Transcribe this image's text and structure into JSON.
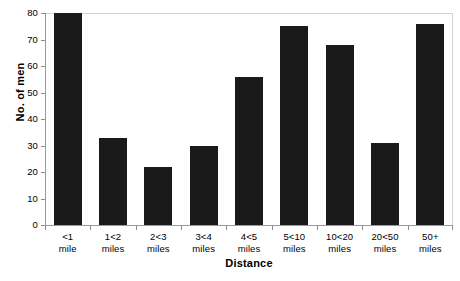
{
  "chart_data": {
    "type": "bar",
    "title": "",
    "xlabel": "Distance",
    "ylabel": "No. of men",
    "categories": [
      "<1 mile",
      "1<2 miles",
      "2<3 miles",
      "3<4 miles",
      "4<5 miles",
      "5<10 miles",
      "10<20 miles",
      "20<50 miles",
      "50+ miles"
    ],
    "category_lines": [
      {
        "line1": "<1",
        "line2": "mile"
      },
      {
        "line1": "1<2",
        "line2": "miles"
      },
      {
        "line1": "2<3",
        "line2": "miles"
      },
      {
        "line1": "3<4",
        "line2": "miles"
      },
      {
        "line1": "4<5",
        "line2": "miles"
      },
      {
        "line1": "5<10",
        "line2": "miles"
      },
      {
        "line1": "10<20",
        "line2": "miles"
      },
      {
        "line1": "20<50",
        "line2": "miles"
      },
      {
        "line1": "50+",
        "line2": "miles"
      }
    ],
    "values": [
      80,
      33,
      22,
      30,
      56,
      75,
      68,
      31,
      76
    ],
    "ylim": [
      0,
      80
    ],
    "yticks": [
      0,
      10,
      20,
      30,
      40,
      50,
      60,
      70,
      80
    ],
    "ytick_labels": [
      "0",
      "10",
      "20",
      "30",
      "40",
      "50",
      "60",
      "70",
      "80"
    ],
    "grid": false,
    "legend": null,
    "bar_color": "#1a1a1a",
    "frame_color": "#d3d3d3",
    "axis_color": "#9a9a9a",
    "background": "#ffffff"
  }
}
